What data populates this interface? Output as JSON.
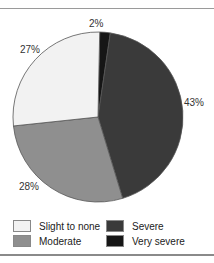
{
  "chart_data": {
    "type": "pie",
    "title": "",
    "categories": [
      "Very severe",
      "Severe",
      "Moderate",
      "Slight to none"
    ],
    "values": [
      2,
      43,
      28,
      27
    ],
    "labels": [
      "2%",
      "43%",
      "28%",
      "27%"
    ],
    "colors": [
      "#161616",
      "#3a3a3a",
      "#8f8f8f",
      "#f2f2f2"
    ],
    "legend_position": "bottom"
  },
  "legend": {
    "items": [
      {
        "label": "Slight to none",
        "color": "#f2f2f2"
      },
      {
        "label": "Severe",
        "color": "#3a3a3a"
      },
      {
        "label": "Moderate",
        "color": "#8f8f8f"
      },
      {
        "label": "Very severe",
        "color": "#161616"
      }
    ]
  }
}
